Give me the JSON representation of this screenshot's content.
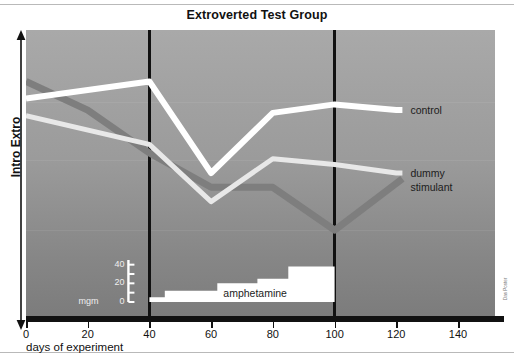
{
  "figure": {
    "title": "Extroverted Test Group",
    "credit": "Das Poster"
  },
  "axes": {
    "y_label": "Intro Extro",
    "x_title": "days of experiment",
    "x_ticks": [
      "0",
      "20",
      "40",
      "60",
      "80",
      "100",
      "120",
      "140"
    ],
    "x_tick_values": [
      0,
      20,
      40,
      60,
      80,
      100,
      120,
      140
    ]
  },
  "series_labels": {
    "control": "control",
    "dummy": "dummy",
    "stimulant": "stimulant"
  },
  "inset": {
    "label": "amphetamine",
    "unit": "mgm",
    "ticks": [
      "40",
      "20",
      "0"
    ],
    "tick_values": [
      40,
      20,
      0
    ]
  },
  "colors": {
    "control": "#ffffff",
    "dummy": "#e8e8e8",
    "stimulant": "#7e7e7e",
    "marker": "#111111",
    "panel_top": "#a9a9a9",
    "panel_bottom": "#7c7c7c",
    "dose_fill": "#ffffff"
  },
  "chart_data": {
    "type": "line",
    "title": "Extroverted Test Group",
    "xlabel": "days of experiment",
    "ylabel": "Intro Extro",
    "xlim": [
      0,
      152
    ],
    "ylim": [
      0,
      100
    ],
    "grid": false,
    "legend_position": "right-inline",
    "annotations": [
      {
        "type": "vline",
        "x": 40,
        "note": "amphetamine start"
      },
      {
        "type": "vline",
        "x": 100,
        "note": "amphetamine stop"
      }
    ],
    "series": [
      {
        "name": "control",
        "color": "#ffffff",
        "x": [
          0,
          40,
          60,
          80,
          100,
          120,
          122
        ],
        "y": [
          76,
          82,
          50,
          71,
          74,
          72,
          72
        ]
      },
      {
        "name": "dummy",
        "color": "#e8e8e8",
        "x": [
          0,
          40,
          60,
          80,
          100,
          120,
          122
        ],
        "y": [
          70,
          60,
          40,
          55,
          53,
          50,
          50
        ]
      },
      {
        "name": "stimulant",
        "color": "#7e7e7e",
        "x": [
          0,
          20,
          40,
          60,
          80,
          100,
          122
        ],
        "y": [
          82,
          72,
          57,
          45,
          45,
          30,
          48
        ]
      }
    ],
    "inset_chart": {
      "type": "area",
      "name": "amphetamine dose",
      "ylabel": "mgm",
      "ylim": [
        0,
        45
      ],
      "steps": [
        {
          "x_start": 40,
          "x_end": 45,
          "dose": 5
        },
        {
          "x_start": 45,
          "x_end": 62,
          "dose": 12
        },
        {
          "x_start": 62,
          "x_end": 75,
          "dose": 20
        },
        {
          "x_start": 75,
          "x_end": 85,
          "dose": 25
        },
        {
          "x_start": 85,
          "x_end": 100,
          "dose": 38
        }
      ]
    }
  }
}
